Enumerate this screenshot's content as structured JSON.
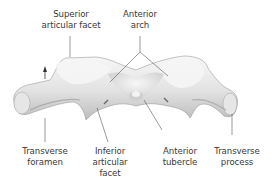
{
  "figure": {
    "labels": {
      "superior_articular_facet": [
        "Superior",
        "articular facet"
      ],
      "anterior_arch": [
        "Anterior",
        "arch"
      ],
      "transverse_foramen": [
        "Transverse",
        "foramen"
      ],
      "inferior_articular_facet": [
        "Inferior",
        "articular",
        "facet"
      ],
      "anterior_tubercle": [
        "Anterior",
        "tubercle"
      ],
      "transverse_process": [
        "Transverse",
        "process"
      ]
    },
    "colors": {
      "bone_light": "#f2f2f2",
      "bone_mid": "#d9d9d9",
      "bone_shadow": "#a8a8a8",
      "leader_line": "#555555",
      "text": "#3a3a3a"
    }
  }
}
